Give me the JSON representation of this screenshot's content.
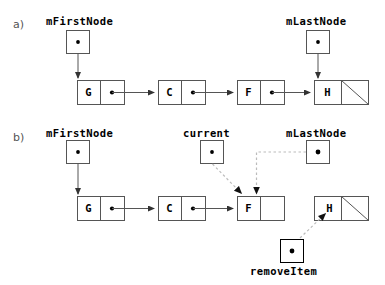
{
  "figure": {
    "width": 385,
    "height": 285,
    "background": "#ffffff",
    "line_color": "#555555",
    "dashed_color": "#bbbbbb",
    "text_color": "#000000"
  },
  "parts": [
    {
      "id": "a",
      "label": "a)",
      "x": 13,
      "y": 18
    },
    {
      "id": "b",
      "label": "b)",
      "x": 13,
      "y": 131
    }
  ],
  "panel_a": {
    "pointers": [
      {
        "name": "mFirstNode",
        "label": "mFirstNode",
        "label_x": 46,
        "label_y": 16,
        "box_x": 66,
        "box_y": 30,
        "box_w": 23,
        "box_h": 23,
        "has_dot": true
      },
      {
        "name": "mLastNode",
        "label": "mLastNode",
        "label_x": 286,
        "label_y": 16,
        "box_x": 306,
        "box_y": 30,
        "box_w": 23,
        "box_h": 23,
        "has_dot": true
      }
    ],
    "nodes": [
      {
        "letter": "G",
        "x": 77,
        "y": 80,
        "w": 47,
        "h": 24,
        "split": 23,
        "has_dot": true,
        "null_slash": false
      },
      {
        "letter": "C",
        "x": 158,
        "y": 80,
        "w": 47,
        "h": 24,
        "split": 23,
        "has_dot": true,
        "null_slash": false
      },
      {
        "letter": "F",
        "x": 237,
        "y": 80,
        "w": 47,
        "h": 24,
        "split": 23,
        "has_dot": true,
        "null_slash": false
      },
      {
        "letter": "H",
        "x": 314,
        "y": 80,
        "w": 54,
        "h": 24,
        "split": 27,
        "has_dot": false,
        "null_slash": true
      }
    ],
    "links": [
      {
        "from": "mFirstNode",
        "to": "G",
        "style": "solid"
      },
      {
        "from": "G",
        "to": "C",
        "style": "solid"
      },
      {
        "from": "C",
        "to": "F",
        "style": "solid"
      },
      {
        "from": "F",
        "to": "H",
        "style": "solid"
      },
      {
        "from": "mLastNode",
        "to": "H",
        "style": "solid"
      }
    ]
  },
  "panel_b": {
    "pointers": [
      {
        "name": "mFirstNode",
        "label": "mFirstNode",
        "label_x": 46,
        "label_y": 128,
        "box_x": 66,
        "box_y": 140,
        "box_w": 23,
        "box_h": 23,
        "has_dot": true
      },
      {
        "name": "current",
        "label": "current",
        "label_x": 183,
        "label_y": 128,
        "box_x": 200,
        "box_y": 140,
        "box_w": 23,
        "box_h": 23,
        "has_dot": true
      },
      {
        "name": "mLastNode",
        "label": "mLastNode",
        "label_x": 286,
        "label_y": 128,
        "box_x": 306,
        "box_y": 140,
        "box_w": 23,
        "box_h": 23,
        "has_dot": true
      },
      {
        "name": "removeItem",
        "label": "removeItem",
        "label_x": 250,
        "label_y": 266,
        "box_x": 280,
        "box_y": 239,
        "box_w": 23,
        "box_h": 23,
        "has_dot": true
      }
    ],
    "nodes": [
      {
        "letter": "G",
        "x": 77,
        "y": 196,
        "w": 47,
        "h": 24,
        "split": 23,
        "has_dot": true,
        "null_slash": false
      },
      {
        "letter": "C",
        "x": 158,
        "y": 196,
        "w": 47,
        "h": 24,
        "split": 23,
        "has_dot": true,
        "null_slash": false
      },
      {
        "letter": "F",
        "x": 237,
        "y": 196,
        "w": 47,
        "h": 24,
        "split": 23,
        "has_dot": false,
        "null_slash": false
      },
      {
        "letter": "H",
        "x": 314,
        "y": 196,
        "w": 54,
        "h": 24,
        "split": 27,
        "has_dot": false,
        "null_slash": true
      }
    ],
    "links": [
      {
        "from": "mFirstNode",
        "to": "G",
        "style": "solid"
      },
      {
        "from": "G",
        "to": "C",
        "style": "solid"
      },
      {
        "from": "C",
        "to": "F",
        "style": "solid"
      },
      {
        "from": "current",
        "to": "F",
        "style": "dashed"
      },
      {
        "from": "mLastNode",
        "to": "F",
        "style": "dashed"
      },
      {
        "from": "removeItem",
        "to": "H",
        "style": "dashed"
      }
    ]
  }
}
